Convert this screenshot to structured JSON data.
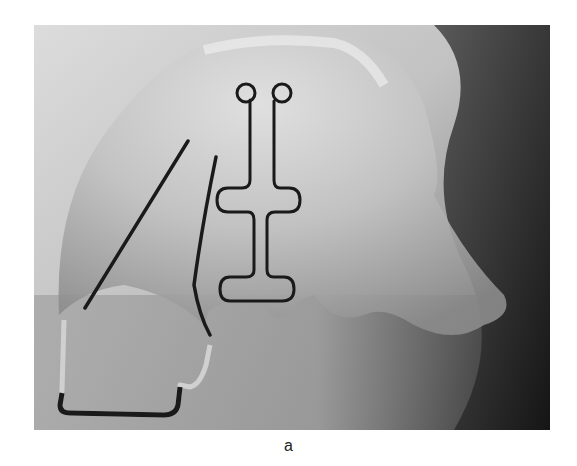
{
  "figure": {
    "caption": "a",
    "colors": {
      "background_light": "#d8d8d8",
      "background_mid": "#a9a9a9",
      "acrylic": "#c4c4c4",
      "wire": "#1a1a1a",
      "dark_region": "#2b2b2b"
    }
  }
}
